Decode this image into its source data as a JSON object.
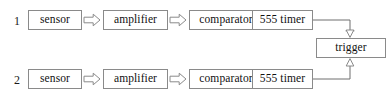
{
  "diagram": {
    "type": "block-diagram",
    "canvas": {
      "width": 391,
      "height": 98
    },
    "style": {
      "background": "#ffffff",
      "box_border": "#8a8a8a",
      "box_fill": "#ffffff",
      "text_color": "#111111",
      "line_color": "#6f6f6f",
      "arrow_fill": "#ffffff",
      "arrow_stroke": "#8a8a8a"
    },
    "rows": [
      {
        "label": "1",
        "nodes": [
          {
            "id": "sensor-1",
            "label": "sensor"
          },
          {
            "id": "amplifier-1",
            "label": "amplifier"
          },
          {
            "id": "comparator-1",
            "label": "comparator"
          },
          {
            "id": "timer-1",
            "label": "555 timer"
          }
        ]
      },
      {
        "label": "2",
        "nodes": [
          {
            "id": "sensor-2",
            "label": "sensor"
          },
          {
            "id": "amplifier-2",
            "label": "amplifier"
          },
          {
            "id": "comparator-2",
            "label": "comparator"
          },
          {
            "id": "timer-2",
            "label": "555 timer"
          }
        ]
      }
    ],
    "shared": {
      "id": "trigger",
      "label": "trigger"
    },
    "connections": [
      {
        "from": "sensor-1",
        "to": "amplifier-1",
        "kind": "block-arrow-right"
      },
      {
        "from": "amplifier-1",
        "to": "comparator-1",
        "kind": "block-arrow-right"
      },
      {
        "from": "comparator-1",
        "to": "timer-1",
        "kind": "block-arrow-right"
      },
      {
        "from": "timer-1",
        "to": "trigger",
        "kind": "elbow-arrow-down"
      },
      {
        "from": "sensor-2",
        "to": "amplifier-2",
        "kind": "block-arrow-right"
      },
      {
        "from": "amplifier-2",
        "to": "comparator-2",
        "kind": "block-arrow-right"
      },
      {
        "from": "comparator-2",
        "to": "timer-2",
        "kind": "block-arrow-right"
      },
      {
        "from": "timer-2",
        "to": "trigger",
        "kind": "elbow-arrow-up"
      }
    ]
  }
}
